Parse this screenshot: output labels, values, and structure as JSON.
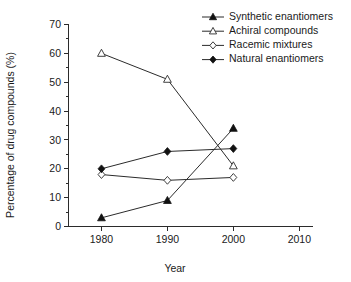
{
  "chart_data": {
    "type": "line",
    "title": "",
    "xlabel": "Year",
    "ylabel": "Percentage of drug compounds (%)",
    "x": [
      1980,
      1990,
      2000
    ],
    "xlim": [
      1975,
      2012
    ],
    "ylim": [
      0,
      70
    ],
    "xticks": [
      "1980",
      "1990",
      "2000",
      "2010"
    ],
    "yticks": [
      "0",
      "10",
      "20",
      "30",
      "40",
      "50",
      "60",
      "70"
    ],
    "y_minor_step": 5,
    "grid": false,
    "legend_position": "top-right",
    "series": [
      {
        "name": "Synthetic enantiomers",
        "marker": "filled-triangle",
        "values": [
          3,
          9,
          34
        ]
      },
      {
        "name": "Achiral compounds",
        "marker": "open-triangle",
        "values": [
          60,
          51,
          21
        ]
      },
      {
        "name": "Racemic mixtures",
        "marker": "open-diamond",
        "values": [
          18,
          16,
          17
        ]
      },
      {
        "name": "Natural enantiomers",
        "marker": "filled-diamond",
        "values": [
          20,
          26,
          27
        ]
      }
    ]
  },
  "legend": {
    "items": [
      {
        "label": "Synthetic enantiomers"
      },
      {
        "label": "Achiral compounds"
      },
      {
        "label": "Racemic mixtures"
      },
      {
        "label": "Natural enantiomers"
      }
    ]
  },
  "axes": {
    "x_title": "Year",
    "y_title": "Percentage of drug compounds (%)"
  }
}
